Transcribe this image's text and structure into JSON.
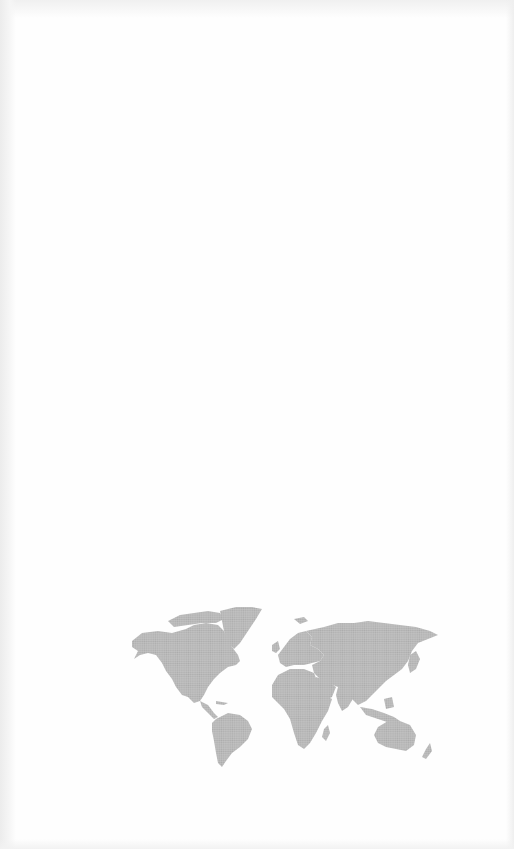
{
  "page": {
    "type": "scanned-blank-page",
    "background_color": "#fefefe",
    "edge_shadow_color": "#ececec"
  },
  "map": {
    "label": "dotted-world-map",
    "dot_color": "#b8b8b8",
    "continents": [
      "North America",
      "Greenland",
      "South America",
      "Europe",
      "Africa",
      "Asia",
      "Australia",
      "New Zealand"
    ]
  }
}
